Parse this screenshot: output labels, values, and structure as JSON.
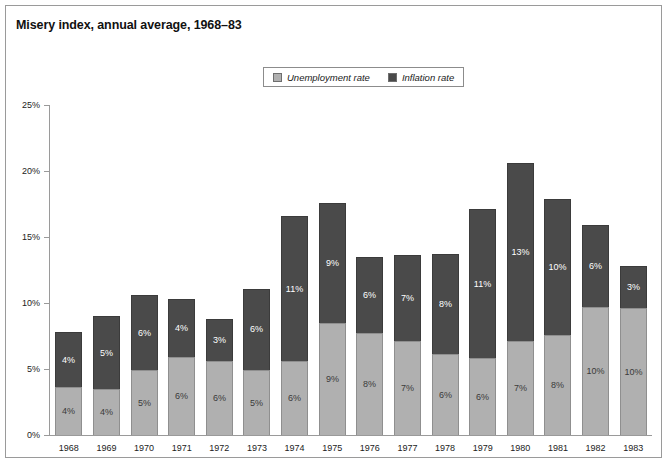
{
  "figure": {
    "title": "Misery index, annual average, 1968–83"
  },
  "legend": {
    "items": [
      {
        "label": "Unemployment rate",
        "swatch": "unemployment",
        "color": "#b0b0b0"
      },
      {
        "label": "Inflation rate",
        "swatch": "inflation",
        "color": "#4a4a4a"
      }
    ]
  },
  "axes": {
    "y_ticks": [
      "0%",
      "5%",
      "10%",
      "15%",
      "20%",
      "25%"
    ],
    "y_tick_values": [
      0,
      5,
      10,
      15,
      20,
      25
    ]
  },
  "chart_data": {
    "type": "bar",
    "subtype": "stacked",
    "title": "Misery index, annual average, 1968–83",
    "xlabel": "",
    "ylabel": "",
    "ylim": [
      0,
      25
    ],
    "ytick_labels": [
      "0%",
      "5%",
      "10%",
      "15%",
      "20%",
      "25%"
    ],
    "grid": false,
    "legend_position": "top-center",
    "categories": [
      "1968",
      "1969",
      "1970",
      "1971",
      "1972",
      "1973",
      "1974",
      "1975",
      "1976",
      "1977",
      "1978",
      "1979",
      "1980",
      "1981",
      "1982",
      "1983"
    ],
    "series": [
      {
        "name": "Unemployment rate",
        "color": "#b0b0b0",
        "values": [
          3.6,
          3.5,
          4.9,
          5.9,
          5.6,
          4.9,
          5.6,
          8.5,
          7.7,
          7.1,
          6.1,
          5.8,
          7.1,
          7.6,
          9.7,
          9.6
        ],
        "labels": [
          "4%",
          "4%",
          "5%",
          "6%",
          "6%",
          "5%",
          "6%",
          "9%",
          "8%",
          "7%",
          "6%",
          "6%",
          "7%",
          "8%",
          "10%",
          "10%"
        ]
      },
      {
        "name": "Inflation rate",
        "color": "#4a4a4a",
        "values": [
          4.2,
          5.5,
          5.7,
          4.4,
          3.2,
          6.2,
          11.0,
          9.1,
          5.8,
          6.5,
          7.6,
          11.3,
          13.5,
          10.3,
          6.2,
          3.2
        ],
        "labels": [
          "4%",
          "5%",
          "6%",
          "4%",
          "3%",
          "6%",
          "11%",
          "9%",
          "6%",
          "7%",
          "8%",
          "11%",
          "13%",
          "10%",
          "6%",
          "3%"
        ]
      }
    ],
    "totals": [
      7.8,
      9.0,
      10.6,
      10.3,
      8.8,
      11.1,
      16.6,
      17.6,
      13.5,
      13.6,
      13.7,
      17.1,
      20.6,
      17.9,
      15.9,
      12.8
    ]
  }
}
